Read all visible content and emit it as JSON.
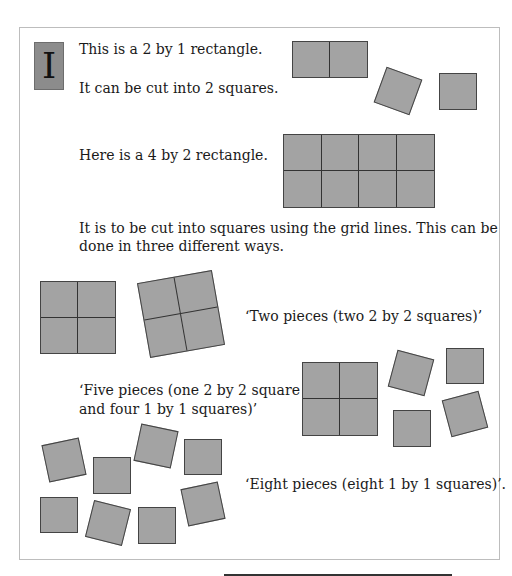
{
  "badge": {
    "letter": "I"
  },
  "text": {
    "line1": "This is a 2 by 1 rectangle.",
    "line2": "It can be cut into 2 squares.",
    "line3": "Here is a 4 by 2 rectangle.",
    "line4a": "It is to be cut into squares using the grid lines. This can be",
    "line4b": "done in three different ways.",
    "way1": "‘Two pieces (two 2 by 2 squares)’",
    "way2a": "‘Five pieces (one 2 by 2 square",
    "way2b": "and four 1 by 1 squares)’",
    "way3": "‘Eight pieces (eight 1 by 1 squares)’."
  },
  "colors": {
    "fill": "#a3a3a3",
    "stroke": "#444444",
    "badge": "#8c8c8c"
  }
}
